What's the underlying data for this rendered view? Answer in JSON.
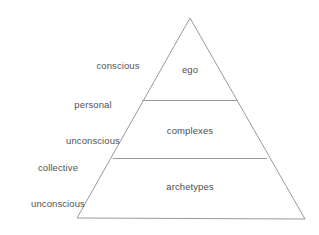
{
  "diagram": {
    "type": "pyramid",
    "background_color": "#ffffff",
    "line_color": "#9a9a9a",
    "text_color": "#555555",
    "geometry": {
      "apex": [
        190,
        18
      ],
      "base_left": [
        77,
        218
      ],
      "base_right": [
        305,
        219
      ],
      "divider_1": [
        [
          142,
          100
        ],
        [
          238,
          100
        ]
      ],
      "divider_2": [
        [
          113,
          158
        ],
        [
          267,
          158
        ]
      ]
    },
    "levels": [
      {
        "inner_label": "ego",
        "outer_label": "conscious",
        "outer_label_lines": [
          "conscious"
        ]
      },
      {
        "inner_label": "complexes",
        "outer_label": "personal unconscious",
        "outer_label_lines": [
          "personal",
          "unconscious"
        ]
      },
      {
        "inner_label": "archetypes",
        "outer_label": "collective unconscious",
        "outer_label_lines": [
          "collective",
          "unconscious"
        ]
      }
    ]
  }
}
